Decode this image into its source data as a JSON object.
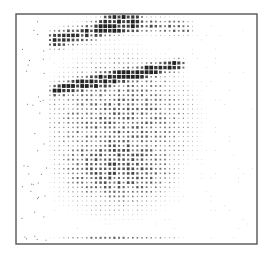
{
  "chart_data": {
    "type": "heatmap",
    "title": "",
    "xlabel": "",
    "ylabel": "",
    "render": "dot-density",
    "grid": false,
    "legend": null,
    "frame": {
      "x": 16,
      "y": 14,
      "width": 241,
      "height": 230,
      "color": "#555555"
    },
    "dot_grid": {
      "x0": 50,
      "x1": 254,
      "y0": 17,
      "y1": 242,
      "step": 4.6
    },
    "dot_color": "#222222",
    "max_radius": 1.9,
    "density_regions": [
      {
        "name": "main-diagonal-band",
        "from": [
          55,
          90
        ],
        "to": [
          180,
          64
        ],
        "width": 3.5,
        "strength": 1.0
      },
      {
        "name": "upper-band",
        "from": [
          55,
          40
        ],
        "to": [
          130,
          22
        ],
        "width": 7,
        "strength": 0.8
      },
      {
        "name": "upper-right-band",
        "from": [
          110,
          22
        ],
        "to": [
          185,
          28
        ],
        "width": 6,
        "strength": 0.6
      },
      {
        "name": "central-cloud",
        "center": [
          120,
          120
        ],
        "radius": [
          85,
          75
        ],
        "strength": 0.55
      },
      {
        "name": "lower-cloud",
        "center": [
          115,
          185
        ],
        "radius": [
          70,
          40
        ],
        "strength": 0.35
      },
      {
        "name": "bottom-row",
        "center": [
          120,
          240
        ],
        "radius": [
          70,
          6
        ],
        "strength": 0.55
      }
    ],
    "falloff_x": 205,
    "sparse_noise": 0.06
  }
}
